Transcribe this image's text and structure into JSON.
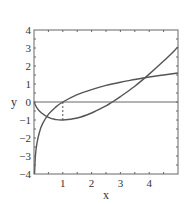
{
  "chart_data": {
    "type": "line",
    "title": "",
    "xlabel": "x",
    "ylabel": "y",
    "xlim": [
      0,
      5
    ],
    "ylim": [
      -4,
      4
    ],
    "xticks": [
      1,
      2,
      3,
      4
    ],
    "yticks": [
      4,
      3,
      2,
      1,
      0,
      -1,
      -2,
      -3,
      -4
    ],
    "grid": false,
    "legend": null,
    "series": [
      {
        "name": "ln(x)",
        "x": [
          0.018,
          0.05,
          0.1,
          0.2,
          0.3,
          0.5,
          0.75,
          1,
          1.5,
          2,
          2.5,
          3,
          3.5,
          4,
          4.5,
          5
        ],
        "values": [
          -4.0,
          -3.0,
          -2.3,
          -1.61,
          -1.2,
          -0.69,
          -0.29,
          0,
          0.41,
          0.69,
          0.92,
          1.1,
          1.25,
          1.39,
          1.5,
          1.61
        ]
      },
      {
        "name": "x ln(x) - x",
        "x": [
          0,
          0.1,
          0.25,
          0.5,
          0.75,
          1,
          1.5,
          2,
          2.5,
          2.72,
          3,
          3.5,
          4,
          4.5,
          5
        ],
        "values": [
          0,
          -0.33,
          -0.6,
          -0.85,
          -0.97,
          -1.0,
          -0.89,
          -0.61,
          -0.21,
          0,
          0.3,
          0.88,
          1.55,
          2.27,
          3.05
        ]
      }
    ],
    "annotations": [
      {
        "type": "hline",
        "y": 0
      },
      {
        "type": "dashed-segment",
        "from": [
          1,
          0
        ],
        "to": [
          1,
          -1
        ]
      }
    ],
    "colors": {
      "curve": "#555555",
      "axis": "#666666",
      "text": "#333333"
    }
  }
}
